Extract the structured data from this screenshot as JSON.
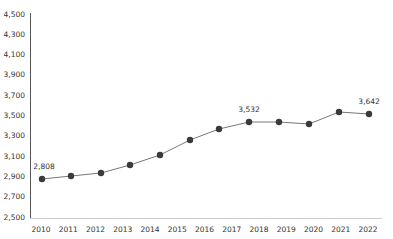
{
  "chart_data": {
    "type": "line",
    "title": "",
    "xlabel": "",
    "ylabel": "",
    "x_tick_labels": [
      "2010",
      "2011",
      "2012",
      "2013",
      "2014",
      "2015",
      "2016",
      "2017",
      "2018",
      "2019",
      "2020",
      "2021",
      "2022"
    ],
    "y_tick_labels": [
      "2,500",
      "2,700",
      "2,900",
      "3,100",
      "3,300",
      "3,500",
      "3,700",
      "3,900",
      "4,100",
      "4,300",
      "4,500"
    ],
    "ylim": [
      2500,
      4500
    ],
    "grid": false,
    "legend": null,
    "series": [
      {
        "name": "value",
        "color": "#3a3a3a",
        "points": [
          {
            "px": 42,
            "py": 179,
            "value": 2808,
            "label": "2,808"
          },
          {
            "px": 71,
            "py": 176,
            "value": 2846,
            "label": ""
          },
          {
            "px": 101,
            "py": 173,
            "value": 2885,
            "label": ""
          },
          {
            "px": 130,
            "py": 165,
            "value": 2988,
            "label": ""
          },
          {
            "px": 160,
            "py": 155,
            "value": 3116,
            "label": ""
          },
          {
            "px": 190,
            "py": 140,
            "value": 3308,
            "label": ""
          },
          {
            "px": 219,
            "py": 129,
            "value": 3449,
            "label": ""
          },
          {
            "px": 249,
            "py": 122,
            "value": 3532,
            "label": "3,532"
          },
          {
            "px": 279,
            "py": 122,
            "value": 3532,
            "label": ""
          },
          {
            "px": 309,
            "py": 124,
            "value": 3507,
            "label": ""
          },
          {
            "px": 339,
            "py": 112,
            "value": 3660,
            "label": ""
          },
          {
            "px": 369,
            "py": 114,
            "value": 3642,
            "label": "3,642"
          }
        ]
      }
    ],
    "annotations": [
      "2,808",
      "3,532",
      "3,642"
    ]
  }
}
